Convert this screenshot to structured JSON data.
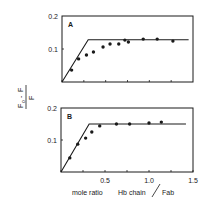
{
  "chart_data": [
    {
      "type": "scatter",
      "panel_label": "A",
      "xlabel": "mole ratio Hb chain / Fab",
      "ylabel": "(F0 - F) / F0",
      "xlim": [
        0,
        1.5
      ],
      "ylim": [
        0,
        0.2
      ],
      "y_ticks": [
        "0.1",
        "0.2"
      ],
      "x_ticks": [
        0,
        0.25,
        0.5,
        0.75,
        1.0,
        1.25
      ],
      "x_tick_labels": [],
      "grid": false,
      "series": [
        {
          "name": "measured",
          "x": [
            0.11,
            0.19,
            0.28,
            0.36,
            0.47,
            0.55,
            0.65,
            0.72,
            0.76,
            0.93,
            1.09,
            1.27
          ],
          "y": [
            0.036,
            0.07,
            0.082,
            0.091,
            0.106,
            0.115,
            0.115,
            0.127,
            0.121,
            0.13,
            0.13,
            0.124
          ]
        },
        {
          "name": "fit-line",
          "x": [
            0,
            0.3,
            1.45
          ],
          "y": [
            0,
            0.128,
            0.128
          ]
        }
      ]
    },
    {
      "type": "scatter",
      "panel_label": "B",
      "xlabel": "mole ratio Hb chain / Fab",
      "ylabel": "(F0 - F) / F0",
      "xlim": [
        0,
        1.5
      ],
      "ylim": [
        0,
        0.2
      ],
      "y_ticks": [
        "0.1",
        "0.2"
      ],
      "x_ticks": [
        0,
        0.25,
        0.5,
        0.75,
        1.0,
        1.25,
        1.5
      ],
      "x_tick_labels": [
        "0.5",
        "1.0",
        "1.5"
      ],
      "grid": false,
      "series": [
        {
          "name": "measured",
          "x": [
            0.1,
            0.19,
            0.28,
            0.35,
            0.44,
            0.63,
            0.78,
            1.0,
            1.14
          ],
          "y": [
            0.044,
            0.087,
            0.106,
            0.125,
            0.144,
            0.15,
            0.15,
            0.153,
            0.156
          ]
        },
        {
          "name": "fit-line",
          "x": [
            0,
            0.32,
            1.42
          ],
          "y": [
            0,
            0.15,
            0.15
          ]
        }
      ]
    }
  ],
  "labels": {
    "panel_a": "A",
    "panel_b": "B",
    "y_tick_a_01": "0.1",
    "y_tick_a_02": "0.2",
    "y_tick_b_01": "0.1",
    "y_tick_b_02": "0.2",
    "x_tick_05": "0.5",
    "x_tick_10": "1.0",
    "x_tick_15": "1.5",
    "xlabel_part1": "mole ratio",
    "xlabel_part2": "Hb chain",
    "xlabel_part3": "Fab",
    "ylabel_num_a": "F",
    "ylabel_num_b": "F",
    "ylabel_sub": "o",
    "ylabel_minus": "-",
    "ylabel_den": "F"
  },
  "colors": {
    "ink": "#1a1a1a",
    "background": "#ffffff"
  }
}
